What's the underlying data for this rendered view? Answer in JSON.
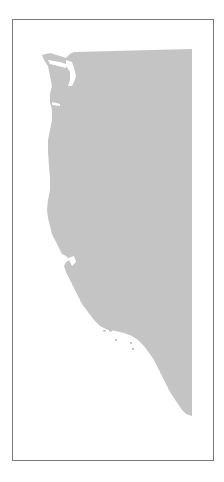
{
  "map": {
    "title": "US West Coast",
    "region_fill": "#c4c4c4",
    "water_fill": "#ffffff",
    "frame_color": "#7a7a7a",
    "regions": [
      "Washington",
      "Oregon",
      "California"
    ]
  }
}
